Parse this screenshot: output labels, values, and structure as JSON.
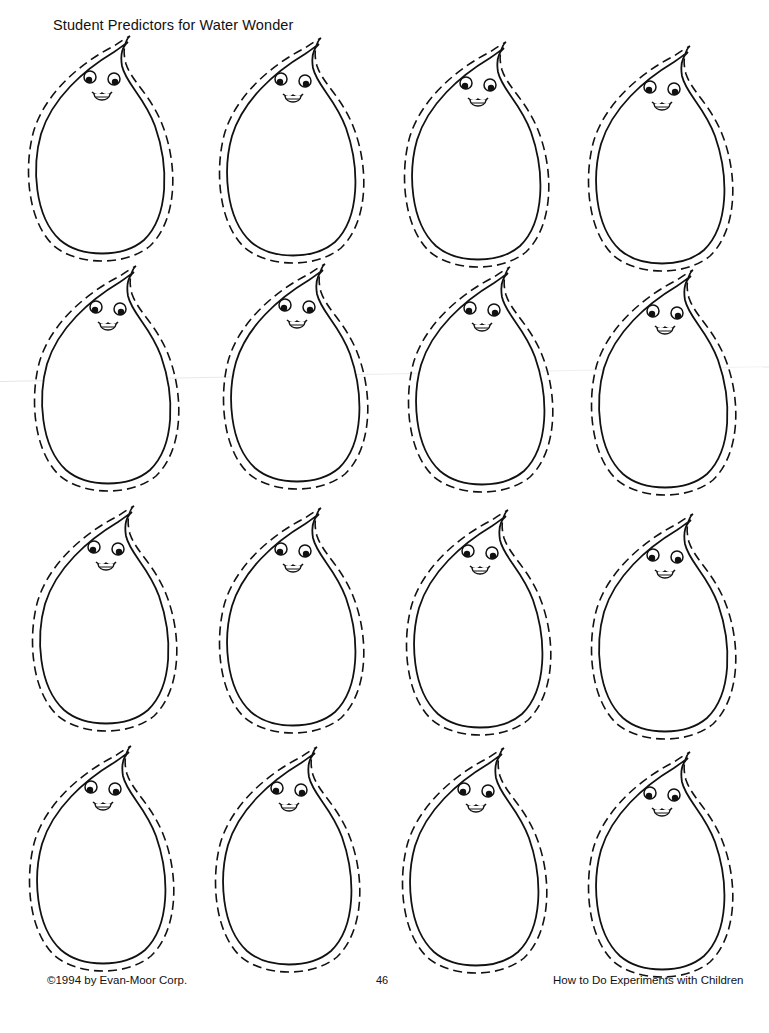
{
  "page": {
    "title": "Student Predictors for Water Wonder",
    "footer": {
      "copyright": "©1994 by Evan-Moor Corp.",
      "page_number": "46",
      "book_title": "How to Do Experiments with Children"
    }
  },
  "grid": {
    "rows": 4,
    "columns": 4,
    "item_type": "water-drop cutout with face",
    "drops": [
      {
        "row": 1,
        "col": 1,
        "x": 22,
        "y": 34
      },
      {
        "row": 1,
        "col": 2,
        "x": 213,
        "y": 36
      },
      {
        "row": 1,
        "col": 3,
        "x": 398,
        "y": 40
      },
      {
        "row": 1,
        "col": 4,
        "x": 582,
        "y": 44
      },
      {
        "row": 2,
        "col": 1,
        "x": 28,
        "y": 264
      },
      {
        "row": 2,
        "col": 2,
        "x": 217,
        "y": 262
      },
      {
        "row": 2,
        "col": 3,
        "x": 402,
        "y": 265
      },
      {
        "row": 2,
        "col": 4,
        "x": 585,
        "y": 268
      },
      {
        "row": 3,
        "col": 1,
        "x": 26,
        "y": 504
      },
      {
        "row": 3,
        "col": 2,
        "x": 213,
        "y": 506
      },
      {
        "row": 3,
        "col": 3,
        "x": 400,
        "y": 508
      },
      {
        "row": 3,
        "col": 4,
        "x": 585,
        "y": 512
      },
      {
        "row": 4,
        "col": 1,
        "x": 23,
        "y": 744
      },
      {
        "row": 4,
        "col": 2,
        "x": 209,
        "y": 745
      },
      {
        "row": 4,
        "col": 3,
        "x": 396,
        "y": 746
      },
      {
        "row": 4,
        "col": 4,
        "x": 582,
        "y": 750
      }
    ]
  },
  "colors": {
    "ink": "#111111",
    "paper": "#ffffff"
  }
}
